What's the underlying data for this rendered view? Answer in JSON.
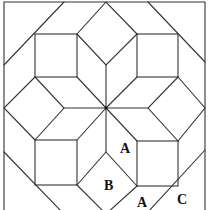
{
  "diagram": {
    "type": "quilt-block",
    "colors": {
      "line": "#333333",
      "background": "#ffffff",
      "label": "#111111"
    },
    "labels": [
      {
        "id": "label-a-upper",
        "text": "A",
        "x": 126,
        "y": 153
      },
      {
        "id": "label-b",
        "text": "B",
        "x": 110,
        "y": 190
      },
      {
        "id": "label-a-lower",
        "text": "A",
        "x": 142,
        "y": 207
      },
      {
        "id": "label-c",
        "text": "C",
        "x": 182,
        "y": 204
      }
    ]
  }
}
